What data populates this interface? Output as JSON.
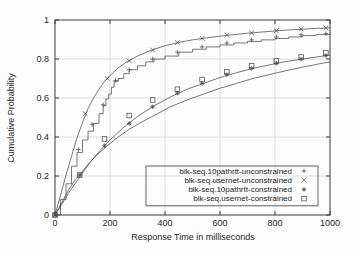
{
  "chart_data": {
    "type": "line",
    "title": "",
    "xlabel": "Response Time in milliseconds",
    "ylabel": "Cumulative Probability",
    "xlim": [
      0,
      1000
    ],
    "ylim": [
      0,
      1
    ],
    "xticks": [
      0,
      200,
      400,
      600,
      800,
      1000
    ],
    "xtick_labels": [
      "0",
      "200",
      "400",
      "600",
      "800",
      "1000"
    ],
    "yticks": [
      0,
      0.2,
      0.4,
      0.6,
      0.8,
      1
    ],
    "ytick_labels": [
      "0",
      "0.2",
      "0.4",
      "0.6",
      "0.8",
      "1"
    ],
    "grid": true,
    "legend_position": "lower right",
    "series": [
      {
        "name": "blk-seq.10pathrtt-unconstrained",
        "marker": "+",
        "style": "staircase",
        "x": [
          0,
          20,
          40,
          60,
          80,
          100,
          120,
          140,
          160,
          175,
          185,
          195,
          205,
          215,
          230,
          250,
          270,
          300,
          330,
          360,
          400,
          450,
          500,
          550,
          600,
          650,
          700,
          750,
          800,
          850,
          900,
          950,
          1000
        ],
        "y": [
          0.0,
          0.08,
          0.16,
          0.25,
          0.32,
          0.385,
          0.43,
          0.47,
          0.52,
          0.56,
          0.595,
          0.62,
          0.655,
          0.685,
          0.7,
          0.725,
          0.745,
          0.765,
          0.785,
          0.8,
          0.815,
          0.835,
          0.85,
          0.862,
          0.872,
          0.882,
          0.89,
          0.898,
          0.905,
          0.913,
          0.92,
          0.926,
          0.93
        ],
        "markers_x": [
          0,
          85,
          135,
          175,
          220,
          270,
          355,
          445,
          535,
          625,
          715,
          805,
          895,
          985
        ],
        "markers_y": [
          0.0,
          0.335,
          0.465,
          0.565,
          0.69,
          0.745,
          0.8,
          0.835,
          0.862,
          0.882,
          0.898,
          0.913,
          0.924,
          0.93
        ]
      },
      {
        "name": "blk-seq.usernet-unconstrained",
        "marker": "x",
        "style": "smooth",
        "x": [
          0,
          20,
          40,
          60,
          80,
          100,
          120,
          140,
          160,
          180,
          200,
          230,
          260,
          300,
          350,
          400,
          450,
          500,
          550,
          600,
          650,
          700,
          750,
          800,
          850,
          900,
          950,
          1000
        ],
        "y": [
          0.0,
          0.1,
          0.205,
          0.3,
          0.395,
          0.475,
          0.545,
          0.6,
          0.645,
          0.685,
          0.715,
          0.755,
          0.785,
          0.815,
          0.845,
          0.868,
          0.885,
          0.898,
          0.908,
          0.917,
          0.925,
          0.932,
          0.938,
          0.944,
          0.949,
          0.953,
          0.957,
          0.96
        ],
        "markers_x": [
          0,
          110,
          190,
          270,
          355,
          445,
          535,
          625,
          715,
          805,
          895,
          985
        ],
        "markers_y": [
          0.0,
          0.52,
          0.7,
          0.79,
          0.846,
          0.884,
          0.906,
          0.922,
          0.934,
          0.945,
          0.953,
          0.96
        ]
      },
      {
        "name": "blk-seq.10pathrtt-constrained",
        "marker": "*",
        "style": "smooth",
        "x": [
          0,
          25,
          50,
          75,
          100,
          130,
          160,
          200,
          250,
          300,
          360,
          420,
          480,
          540,
          600,
          660,
          720,
          780,
          840,
          900,
          960,
          1000
        ],
        "y": [
          0.0,
          0.055,
          0.115,
          0.165,
          0.215,
          0.275,
          0.325,
          0.385,
          0.45,
          0.505,
          0.56,
          0.605,
          0.645,
          0.675,
          0.705,
          0.73,
          0.752,
          0.77,
          0.787,
          0.8,
          0.812,
          0.82
        ],
        "markers_x": [
          0,
          90,
          180,
          270,
          355,
          445,
          535,
          625,
          715,
          805,
          895,
          985
        ],
        "markers_y": [
          0.0,
          0.205,
          0.355,
          0.47,
          0.555,
          0.625,
          0.675,
          0.72,
          0.752,
          0.778,
          0.8,
          0.818
        ]
      },
      {
        "name": "blk-seq.usernet-constrained",
        "marker": "square",
        "style": "smooth",
        "x": [
          0,
          25,
          50,
          75,
          90,
          120,
          150,
          190,
          230,
          270,
          320,
          360,
          420,
          480,
          540,
          600,
          660,
          720,
          780,
          840,
          900,
          960,
          1000
        ],
        "y": [
          0.0,
          0.065,
          0.13,
          0.185,
          0.205,
          0.26,
          0.305,
          0.355,
          0.4,
          0.44,
          0.48,
          0.51,
          0.555,
          0.59,
          0.62,
          0.65,
          0.675,
          0.7,
          0.72,
          0.74,
          0.758,
          0.775,
          0.785
        ],
        "markers_x": [
          0,
          90,
          180,
          270,
          355,
          445,
          535,
          625,
          715,
          805,
          895,
          985
        ],
        "markers_y": [
          0.0,
          0.205,
          0.39,
          0.51,
          0.59,
          0.645,
          0.695,
          0.735,
          0.765,
          0.79,
          0.81,
          0.832
        ]
      }
    ]
  },
  "legend": {
    "entries": [
      {
        "label": "blk-seq.10pathrtt-unconstrained",
        "marker": "+"
      },
      {
        "label": "blk-seq.usernet-unconstrained",
        "marker": "x"
      },
      {
        "label": "blk-seq.10pathrtt-constrained",
        "marker": "*"
      },
      {
        "label": "blk-seq.usernet-constrained",
        "marker": "square"
      }
    ]
  },
  "colors": {
    "line": "#4a4a4a",
    "axis": "#3a3a3a",
    "grid": "#c9c9c9",
    "background": "#ffffff",
    "text": "#1c1c1c"
  }
}
